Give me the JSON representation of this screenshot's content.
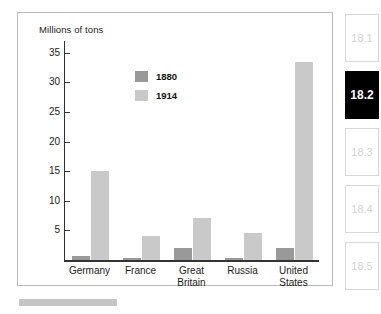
{
  "chart_data": {
    "type": "bar",
    "title": "",
    "ylabel": "Millions of tons",
    "xlabel": "",
    "ylim": [
      0,
      37
    ],
    "yticks": [
      5,
      10,
      15,
      20,
      25,
      30,
      35
    ],
    "grid": false,
    "legend_position": "upper-center-left",
    "categories": [
      "Germany",
      "France",
      "Great Britain",
      "Russia",
      "United States"
    ],
    "category_lines": [
      [
        "Germany"
      ],
      [
        "France"
      ],
      [
        "Great",
        "Britain"
      ],
      [
        "Russia"
      ],
      [
        "United",
        "States"
      ]
    ],
    "series": [
      {
        "name": "1880",
        "color": "#999999",
        "values": [
          0.7,
          0.4,
          2.0,
          0.4,
          2.1
        ]
      },
      {
        "name": "1914",
        "color": "#c9c9c9",
        "values": [
          15.0,
          4.0,
          7.1,
          4.6,
          33.4
        ]
      }
    ]
  },
  "sidebar": {
    "tabs": [
      {
        "label": "18.1",
        "active": false
      },
      {
        "label": "18.2",
        "active": true
      },
      {
        "label": "18.3",
        "active": false
      },
      {
        "label": "18.4",
        "active": false
      },
      {
        "label": "18.5",
        "active": false
      }
    ]
  },
  "colors": {
    "series_1880": "#999999",
    "series_1914": "#c9c9c9",
    "axis": "#333333",
    "frame": "#b9b9b9",
    "active_tab_bg": "#000000",
    "bottom_rule": "#c5c5c5"
  }
}
